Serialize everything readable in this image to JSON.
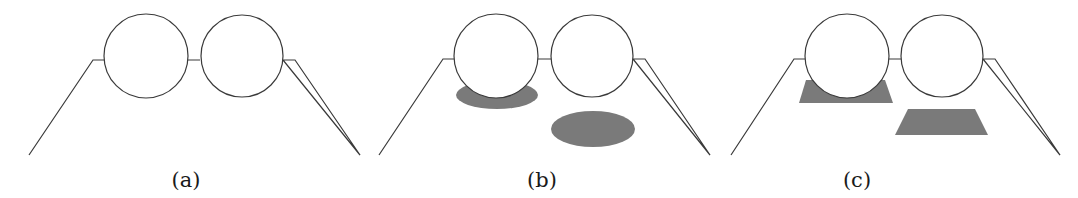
{
  "figure": {
    "panels": [
      {
        "id": "a",
        "label": "(a)",
        "shadow_type": "none",
        "trapezoid": "29,155 93,60 104,60 M 187,60 L 201,60 M 283,60 L 295,60 360,155 Z",
        "circles": [
          {
            "cx": 146,
            "cy": 56,
            "r": 42
          },
          {
            "cx": 242,
            "cy": 56,
            "r": 41
          }
        ],
        "label_x": 186,
        "label_y": 186
      },
      {
        "id": "b",
        "label": "(b)",
        "shadow_type": "ellipse",
        "shadows": [
          {
            "cx": 497,
            "cy": 95,
            "rx": 41,
            "ry": 14
          },
          {
            "cx": 593,
            "cy": 129,
            "rx": 42,
            "ry": 18
          }
        ],
        "circles": [
          {
            "cx": 496,
            "cy": 56,
            "r": 42
          },
          {
            "cx": 592,
            "cy": 56,
            "r": 41
          }
        ],
        "label_x": 542,
        "label_y": 186
      },
      {
        "id": "c",
        "label": "(c)",
        "shadow_type": "trapezoid",
        "shadows": [
          {
            "points": "806,80 885,80 893,103 799,103"
          },
          {
            "points": "908,109 975,109 988,135 895,135"
          }
        ],
        "circles": [
          {
            "cx": 847,
            "cy": 56,
            "r": 42
          },
          {
            "cx": 942,
            "cy": 56,
            "r": 41
          }
        ],
        "label_x": 857,
        "label_y": 186
      }
    ],
    "colors": {
      "outline": "#3a3a3a",
      "shadow": "#7a7a7a",
      "background": "#ffffff"
    }
  }
}
